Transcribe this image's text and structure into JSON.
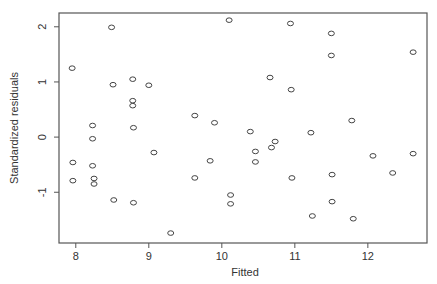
{
  "chart_data": {
    "type": "scatter",
    "title": "",
    "xlabel": "Fitted",
    "ylabel": "Standardized residuals",
    "xlim": [
      7.77,
      12.81
    ],
    "ylim": [
      -1.92,
      2.25
    ],
    "x_ticks": [
      8,
      9,
      10,
      11,
      12
    ],
    "y_ticks": [
      -1,
      0,
      1,
      2
    ],
    "grid": false,
    "legend": null,
    "marker": "open-circle",
    "points": [
      {
        "x": 7.95,
        "y": 1.25
      },
      {
        "x": 7.96,
        "y": -0.46
      },
      {
        "x": 7.96,
        "y": -0.79
      },
      {
        "x": 8.23,
        "y": 0.21
      },
      {
        "x": 8.23,
        "y": -0.03
      },
      {
        "x": 8.23,
        "y": -0.52
      },
      {
        "x": 8.25,
        "y": -0.75
      },
      {
        "x": 8.25,
        "y": -0.85
      },
      {
        "x": 8.49,
        "y": 1.99
      },
      {
        "x": 8.51,
        "y": 0.95
      },
      {
        "x": 8.52,
        "y": -1.14
      },
      {
        "x": 8.78,
        "y": 1.05
      },
      {
        "x": 8.78,
        "y": 0.66
      },
      {
        "x": 8.78,
        "y": 0.57
      },
      {
        "x": 8.79,
        "y": 0.17
      },
      {
        "x": 8.79,
        "y": -1.19
      },
      {
        "x": 9.0,
        "y": 0.94
      },
      {
        "x": 9.07,
        "y": -0.28
      },
      {
        "x": 9.3,
        "y": -1.74
      },
      {
        "x": 9.63,
        "y": 0.39
      },
      {
        "x": 9.63,
        "y": -0.74
      },
      {
        "x": 9.84,
        "y": -0.43
      },
      {
        "x": 9.9,
        "y": 0.26
      },
      {
        "x": 10.1,
        "y": 2.12
      },
      {
        "x": 10.12,
        "y": -1.05
      },
      {
        "x": 10.12,
        "y": -1.21
      },
      {
        "x": 10.39,
        "y": 0.1
      },
      {
        "x": 10.46,
        "y": -0.26
      },
      {
        "x": 10.46,
        "y": -0.45
      },
      {
        "x": 10.66,
        "y": 1.08
      },
      {
        "x": 10.68,
        "y": -0.19
      },
      {
        "x": 10.73,
        "y": -0.08
      },
      {
        "x": 10.94,
        "y": 2.06
      },
      {
        "x": 10.95,
        "y": 0.86
      },
      {
        "x": 10.96,
        "y": -0.74
      },
      {
        "x": 11.22,
        "y": 0.08
      },
      {
        "x": 11.24,
        "y": -1.43
      },
      {
        "x": 11.5,
        "y": 1.88
      },
      {
        "x": 11.5,
        "y": 1.48
      },
      {
        "x": 11.51,
        "y": -0.68
      },
      {
        "x": 11.51,
        "y": -1.17
      },
      {
        "x": 11.78,
        "y": 0.3
      },
      {
        "x": 11.8,
        "y": -1.48
      },
      {
        "x": 12.07,
        "y": -0.34
      },
      {
        "x": 12.34,
        "y": -0.65
      },
      {
        "x": 12.62,
        "y": 1.54
      },
      {
        "x": 12.62,
        "y": -0.3
      }
    ]
  },
  "style": {
    "point_color": "#444444",
    "axis_color": "#555555",
    "text_color": "#333333",
    "background": "#ffffff"
  }
}
